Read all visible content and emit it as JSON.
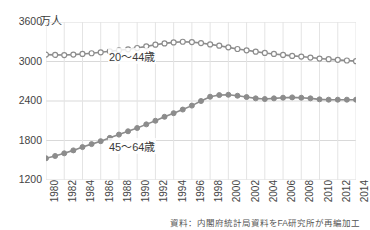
{
  "chart_data": {
    "type": "line",
    "title": "",
    "subtitle": "",
    "unit_label": "万人",
    "xlabel": "",
    "ylabel": "",
    "ylim": [
      1200,
      3600
    ],
    "yticks": [
      1200,
      1800,
      2400,
      3000,
      3600
    ],
    "grid": true,
    "legend_position": "inline-annotation",
    "x": [
      1980,
      1981,
      1982,
      1983,
      1984,
      1985,
      1986,
      1987,
      1988,
      1989,
      1990,
      1991,
      1992,
      1993,
      1994,
      1995,
      1996,
      1997,
      1998,
      1999,
      2000,
      2001,
      2002,
      2003,
      2004,
      2005,
      2006,
      2007,
      2008,
      2009,
      2010,
      2011,
      2012,
      2013,
      2014
    ],
    "xtick_labels": [
      "1980",
      "1982",
      "1984",
      "1986",
      "1988",
      "1990",
      "1992",
      "1994",
      "1996",
      "1998",
      "2000",
      "2002",
      "2004",
      "2006",
      "2008",
      "2010",
      "2012",
      "2014"
    ],
    "xtick_values": [
      1980,
      1982,
      1984,
      1986,
      1988,
      1990,
      1992,
      1994,
      1996,
      1998,
      2000,
      2002,
      2004,
      2006,
      2008,
      2010,
      2012,
      2014
    ],
    "series": [
      {
        "name": "20～44歳",
        "marker": "open-circle",
        "color": "#8c8c8c",
        "values": [
          3105,
          3100,
          3098,
          3105,
          3115,
          3125,
          3140,
          3155,
          3170,
          3185,
          3205,
          3230,
          3255,
          3275,
          3290,
          3300,
          3295,
          3280,
          3260,
          3240,
          3215,
          3190,
          3170,
          3150,
          3130,
          3115,
          3100,
          3085,
          3075,
          3060,
          3045,
          3035,
          3025,
          3015,
          3005
        ]
      },
      {
        "name": "45～64歳",
        "marker": "filled-circle",
        "color": "#8c8c8c",
        "values": [
          1530,
          1565,
          1605,
          1650,
          1700,
          1745,
          1790,
          1840,
          1890,
          1940,
          1990,
          2045,
          2100,
          2160,
          2215,
          2270,
          2330,
          2400,
          2465,
          2490,
          2495,
          2480,
          2460,
          2440,
          2430,
          2440,
          2450,
          2455,
          2450,
          2440,
          2425,
          2420,
          2420,
          2420,
          2420
        ]
      }
    ],
    "annotations": [
      {
        "text": "20～44歳",
        "x": 1992,
        "y": 3020
      },
      {
        "text": "45～64歳",
        "x": 1992,
        "y": 1830
      }
    ],
    "source_note": "資料：内閣府統計局資料をFA研究所が再編加工"
  }
}
